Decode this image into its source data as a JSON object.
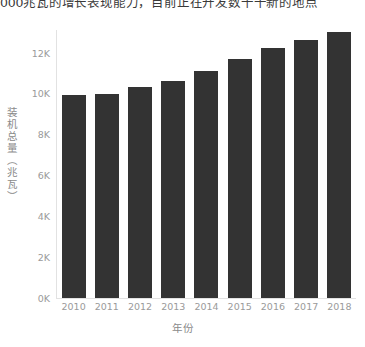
{
  "caption": {
    "text": "000兆瓦的增长表现能力，目前正在开发数千千新的地点"
  },
  "chart_data": {
    "type": "bar",
    "title": "",
    "xlabel": "年份",
    "ylabel": "装机总量（兆瓦）",
    "categories": [
      "2010",
      "2011",
      "2012",
      "2013",
      "2014",
      "2015",
      "2016",
      "2017",
      "2018"
    ],
    "values": [
      9900,
      9950,
      10300,
      10600,
      11100,
      11700,
      12200,
      12600,
      13000
    ],
    "ylim": [
      0,
      13100
    ],
    "yticks": [
      0,
      2000,
      4000,
      6000,
      8000,
      10000,
      12000
    ],
    "ytick_labels": [
      "0K",
      "2K",
      "4K",
      "6K",
      "8K",
      "10K",
      "12K"
    ],
    "grid": false,
    "legend": "none",
    "bar_color": "#333333",
    "axis_color": "#e2e2e2",
    "tick_label_color": "#9a9a9a",
    "axis_title_color": "#8a8a8a"
  }
}
